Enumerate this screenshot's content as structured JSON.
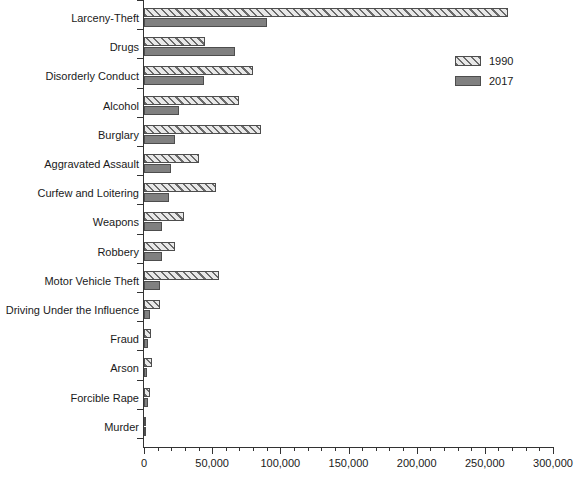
{
  "chart_data": {
    "type": "bar",
    "orientation": "horizontal",
    "title": "",
    "xlabel": "",
    "ylabel": "",
    "xlim": [
      0,
      300000
    ],
    "grid": false,
    "legend_position": "top-right",
    "xtick_labels": [
      "0",
      "50,000",
      "100,000",
      "150,000",
      "200,000",
      "250,000",
      "300,000"
    ],
    "xtick_values": [
      0,
      50000,
      100000,
      150000,
      200000,
      250000,
      300000
    ],
    "minor_tick_interval": 10000,
    "categories": [
      "Larceny-Theft",
      "Drugs",
      "Disorderly Conduct",
      "Alcohol",
      "Burglary",
      "Aggravated Assault",
      "Curfew and Loitering",
      "Weapons",
      "Robbery",
      "Motor Vehicle Theft",
      "Driving Under the Influence",
      "Fraud",
      "Arson",
      "Forcible Rape",
      "Murder"
    ],
    "series": [
      {
        "name": "1990",
        "color": "#e8e8e8",
        "pattern": "forward-hatch",
        "values": [
          267000,
          45000,
          80000,
          70000,
          86000,
          40000,
          53000,
          29000,
          23000,
          55000,
          12000,
          5000,
          6000,
          4500,
          1600
        ]
      },
      {
        "name": "2017",
        "color": "#808080",
        "pattern": "solid",
        "values": [
          90000,
          67000,
          44000,
          26000,
          23000,
          20000,
          18000,
          13000,
          13000,
          12000,
          4500,
          3000,
          2200,
          3000,
          900
        ]
      }
    ]
  },
  "legend": {
    "entries": [
      {
        "label": "1990"
      },
      {
        "label": "2017"
      }
    ]
  }
}
